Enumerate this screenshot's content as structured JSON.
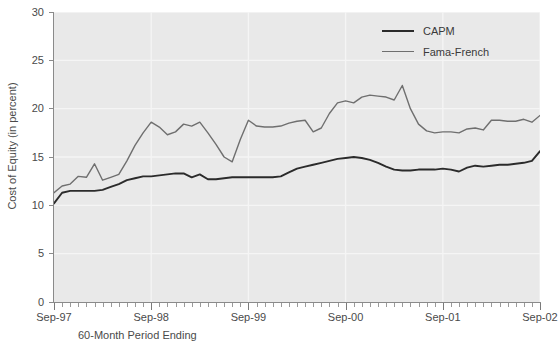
{
  "chart_data": {
    "type": "line",
    "title": "",
    "xlabel": "60-Month Period Ending",
    "ylabel": "Cost of Equity (in percent)",
    "ylim": [
      0,
      30
    ],
    "yticks": [
      0,
      5,
      10,
      15,
      20,
      25,
      30
    ],
    "grid": true,
    "legend_position": "top-right",
    "x_tick_labels": [
      "Sep-97",
      "Sep-98",
      "Sep-99",
      "Sep-00",
      "Sep-01",
      "Sep-02"
    ],
    "x_minor_ticks_per_interval": 12,
    "x": [
      "Sep-97",
      "Oct-97",
      "Nov-97",
      "Dec-97",
      "Jan-98",
      "Feb-98",
      "Mar-98",
      "Apr-98",
      "May-98",
      "Jun-98",
      "Jul-98",
      "Aug-98",
      "Sep-98",
      "Oct-98",
      "Nov-98",
      "Dec-98",
      "Jan-99",
      "Feb-99",
      "Mar-99",
      "Apr-99",
      "May-99",
      "Jun-99",
      "Jul-99",
      "Aug-99",
      "Sep-99",
      "Oct-99",
      "Nov-99",
      "Dec-99",
      "Jan-00",
      "Feb-00",
      "Mar-00",
      "Apr-00",
      "May-00",
      "Jun-00",
      "Jul-00",
      "Aug-00",
      "Sep-00",
      "Oct-00",
      "Nov-00",
      "Dec-00",
      "Jan-01",
      "Feb-01",
      "Mar-01",
      "Apr-01",
      "May-01",
      "Jun-01",
      "Jul-01",
      "Aug-01",
      "Sep-01",
      "Oct-01",
      "Nov-01",
      "Dec-01",
      "Jan-02",
      "Feb-02",
      "Mar-02",
      "Apr-02",
      "May-02",
      "Jun-02",
      "Jul-02",
      "Aug-02",
      "Sep-02"
    ],
    "series": [
      {
        "name": "CAPM",
        "color": "#2b2b2b",
        "values": [
          10.2,
          11.3,
          11.5,
          11.5,
          11.5,
          11.5,
          11.6,
          11.9,
          12.2,
          12.6,
          12.8,
          13.0,
          13.0,
          13.1,
          13.2,
          13.3,
          13.3,
          12.9,
          13.2,
          12.7,
          12.7,
          12.8,
          12.9,
          12.9,
          12.9,
          12.9,
          12.9,
          12.9,
          13.0,
          13.4,
          13.8,
          14.0,
          14.2,
          14.4,
          14.6,
          14.8,
          14.9,
          15.0,
          14.9,
          14.7,
          14.4,
          14.0,
          13.7,
          13.6,
          13.6,
          13.7,
          13.7,
          13.7,
          13.8,
          13.7,
          13.5,
          13.9,
          14.1,
          14.0,
          14.1,
          14.2,
          14.2,
          14.3,
          14.4,
          14.6,
          15.6
        ]
      },
      {
        "name": "Fama-French",
        "color": "#6f6f6f",
        "values": [
          11.3,
          12.0,
          12.2,
          13.0,
          12.9,
          14.3,
          12.6,
          12.9,
          13.2,
          14.6,
          16.2,
          17.5,
          18.6,
          18.1,
          17.3,
          17.6,
          18.4,
          18.2,
          18.6,
          17.5,
          16.3,
          15.0,
          14.5,
          16.8,
          18.8,
          18.2,
          18.1,
          18.1,
          18.2,
          18.5,
          18.7,
          18.8,
          17.6,
          18.0,
          19.5,
          20.6,
          20.8,
          20.6,
          21.2,
          21.4,
          21.3,
          21.2,
          20.9,
          22.4,
          20.0,
          18.4,
          17.7,
          17.5,
          17.6,
          17.6,
          17.5,
          17.9,
          18.0,
          17.8,
          18.8,
          18.8,
          18.7,
          18.7,
          18.9,
          18.6,
          19.3
        ]
      }
    ]
  },
  "legend": {
    "items": [
      {
        "label": "CAPM"
      },
      {
        "label": "Fama-French"
      }
    ]
  },
  "axes": {
    "y_title": "Cost of Equity (in percent)",
    "x_title": "60-Month Period Ending",
    "y_tick_labels": [
      "30",
      "25",
      "20",
      "15",
      "10",
      "5",
      "0"
    ],
    "x_tick_labels": [
      "Sep-97",
      "Sep-98",
      "Sep-99",
      "Sep-00",
      "Sep-01",
      "Sep-02"
    ]
  },
  "colors": {
    "plot_background": "#e9e9e9",
    "gridline": "#f5f5f5",
    "axis": "#8a8a8a",
    "capm_line": "#2b2b2b",
    "fama_french_line": "#6f6f6f",
    "text": "#4a4a4a"
  }
}
